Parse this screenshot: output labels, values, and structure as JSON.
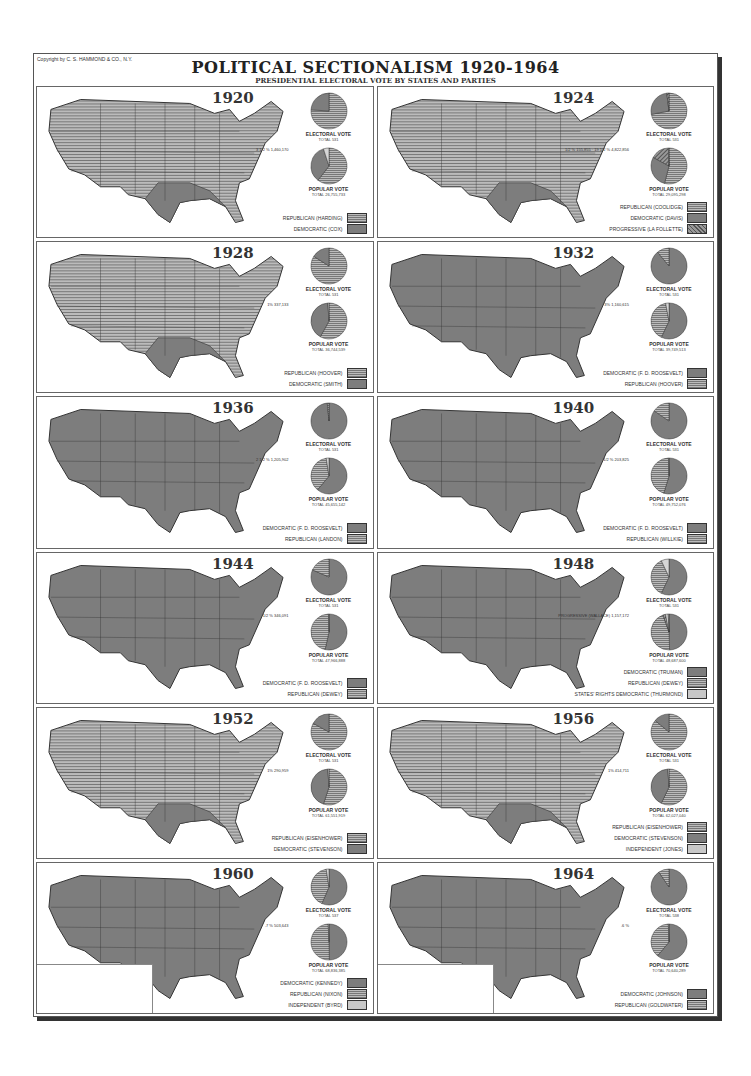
{
  "header": {
    "copyright": "Copyright by C. S. HAMMOND & CO., N.Y.",
    "title": "POLITICAL SECTIONALISM 1920-1964",
    "subtitle": "PRESIDENTIAL ELECTORAL VOTE BY STATES AND PARTIES"
  },
  "colors": {
    "republican": "#b3b3b3",
    "democratic": "#7d7d7d",
    "progressive": "#8a8a8a",
    "independent": "#c8c8c8"
  },
  "labels": {
    "electoral": "ELECTORAL VOTE",
    "popular": "POPULAR VOTE",
    "minor": "MINOR"
  },
  "panels": [
    {
      "year": "1920",
      "electoral_total": "TOTAL 531",
      "popular_total": "TOTAL 26,755,733",
      "minor": "3 1/2 % 1,460,170",
      "legend": [
        {
          "label": "REPUBLICAN (HARDING)",
          "type": "rep"
        },
        {
          "label": "DEMOCRATIC (COX)",
          "type": "dem"
        }
      ]
    },
    {
      "year": "1924",
      "electoral_total": "TOTAL 531",
      "popular_total": "TOTAL 29,095,298",
      "minor": "1/2 % 155,855 · 19 1/2 % 4,822,856",
      "legend": [
        {
          "label": "REPUBLICAN (COOLIDGE)",
          "type": "rep"
        },
        {
          "label": "DEMOCRATIC (DAVIS)",
          "type": "dem"
        },
        {
          "label": "PROGRESSIVE (LA FOLLETTE)",
          "type": "prog"
        }
      ]
    },
    {
      "year": "1928",
      "electoral_total": "TOTAL 531",
      "popular_total": "TOTAL 36,744,539",
      "minor": "1% 337,133",
      "legend": [
        {
          "label": "REPUBLICAN (HOOVER)",
          "type": "rep"
        },
        {
          "label": "DEMOCRATIC (SMITH)",
          "type": "dem"
        }
      ]
    },
    {
      "year": "1932",
      "electoral_total": "TOTAL 531",
      "popular_total": "TOTAL 39,749,513",
      "minor": "3% 1,160,615",
      "legend": [
        {
          "label": "DEMOCRATIC (F. D. ROOSEVELT)",
          "type": "dem"
        },
        {
          "label": "REPUBLICAN (HOOVER)",
          "type": "rep"
        }
      ]
    },
    {
      "year": "1936",
      "electoral_total": "TOTAL 531",
      "popular_total": "TOTAL 45,655,142",
      "minor": "2 1/2 % 1,205,902",
      "legend": [
        {
          "label": "DEMOCRATIC (F. D. ROOSEVELT)",
          "type": "dem"
        },
        {
          "label": "REPUBLICAN (LANDON)",
          "type": "rep"
        }
      ]
    },
    {
      "year": "1940",
      "electoral_total": "TOTAL 531",
      "popular_total": "TOTAL 49,752,076",
      "minor": "1/2 % 203,825",
      "legend": [
        {
          "label": "DEMOCRATIC (F. D. ROOSEVELT)",
          "type": "dem"
        },
        {
          "label": "REPUBLICAN (WILLKIE)",
          "type": "rep"
        }
      ]
    },
    {
      "year": "1944",
      "electoral_total": "TOTAL 531",
      "popular_total": "TOTAL 47,966,888",
      "minor": "1/2 % 346,091",
      "legend": [
        {
          "label": "DEMOCRATIC (F. D. ROOSEVELT)",
          "type": "dem"
        },
        {
          "label": "REPUBLICAN (DEWEY)",
          "type": "rep"
        }
      ]
    },
    {
      "year": "1948",
      "electoral_total": "TOTAL 531",
      "popular_total": "TOTAL 48,687,600",
      "minor": "PROGRESSIVE (WALLACE) 1,157,172",
      "legend": [
        {
          "label": "DEMOCRATIC (TRUMAN)",
          "type": "dem"
        },
        {
          "label": "REPUBLICAN (DEWEY)",
          "type": "rep"
        },
        {
          "label": "STATES' RIGHTS DEMOCRATIC (THURMOND)",
          "type": "ind"
        }
      ]
    },
    {
      "year": "1952",
      "electoral_total": "TOTAL 531",
      "popular_total": "TOTAL 61,551,919",
      "minor": "1% 290,959",
      "legend": [
        {
          "label": "REPUBLICAN (EISENHOWER)",
          "type": "rep"
        },
        {
          "label": "DEMOCRATIC (STEVENSON)",
          "type": "dem"
        }
      ]
    },
    {
      "year": "1956",
      "electoral_total": "TOTAL 531",
      "popular_total": "TOTAL 62,027,040",
      "minor": "1% 414,711",
      "legend": [
        {
          "label": "REPUBLICAN (EISENHOWER)",
          "type": "rep"
        },
        {
          "label": "DEMOCRATIC (STEVENSON)",
          "type": "dem"
        },
        {
          "label": "INDEPENDENT (JONES)",
          "type": "ind"
        }
      ]
    },
    {
      "year": "1960",
      "electoral_total": "TOTAL 537",
      "popular_total": "TOTAL 68,836,385",
      "minor": ".7 % 503,643",
      "legend": [
        {
          "label": "DEMOCRATIC (KENNEDY)",
          "type": "dem"
        },
        {
          "label": "REPUBLICAN (NIXON)",
          "type": "rep"
        },
        {
          "label": "INDEPENDENT (BYRD)",
          "type": "ind"
        }
      ]
    },
    {
      "year": "1964",
      "electoral_total": "TOTAL 538",
      "popular_total": "TOTAL 70,640,289",
      "minor": ".6 %",
      "legend": [
        {
          "label": "DEMOCRATIC (JOHNSON)",
          "type": "dem"
        },
        {
          "label": "REPUBLICAN (GOLDWATER)",
          "type": "rep"
        }
      ]
    }
  ],
  "chart_data": [
    {
      "type": "pie",
      "title": "1920 Electoral Vote",
      "categories": [
        "Republican",
        "Democratic"
      ],
      "values": [
        76,
        24
      ]
    },
    {
      "type": "pie",
      "title": "1920 Popular Vote",
      "categories": [
        "Republican",
        "Democratic",
        "Minor"
      ],
      "values": [
        60.5,
        34.5,
        5
      ]
    },
    {
      "type": "pie",
      "title": "1924 Electoral Vote",
      "categories": [
        "Republican",
        "Democratic",
        "Progressive"
      ],
      "values": [
        72,
        26,
        2
      ]
    },
    {
      "type": "pie",
      "title": "1924 Popular Vote",
      "categories": [
        "Republican",
        "Democratic",
        "Progressive",
        "Minor"
      ],
      "values": [
        54,
        29,
        16.5,
        0.5
      ]
    },
    {
      "type": "pie",
      "title": "1928 Electoral Vote",
      "categories": [
        "Republican",
        "Democratic"
      ],
      "values": [
        84,
        16
      ]
    },
    {
      "type": "pie",
      "title": "1928 Popular Vote",
      "categories": [
        "Republican",
        "Democratic",
        "Minor"
      ],
      "values": [
        58,
        41,
        1
      ]
    },
    {
      "type": "pie",
      "title": "1932 Electoral Vote",
      "categories": [
        "Democratic",
        "Republican"
      ],
      "values": [
        89,
        11
      ]
    },
    {
      "type": "pie",
      "title": "1932 Popular Vote",
      "categories": [
        "Democratic",
        "Republican",
        "Minor"
      ],
      "values": [
        57,
        40,
        3
      ]
    },
    {
      "type": "pie",
      "title": "1936 Electoral Vote",
      "categories": [
        "Democratic",
        "Republican"
      ],
      "values": [
        98.5,
        1.5
      ]
    },
    {
      "type": "pie",
      "title": "1936 Popular Vote",
      "categories": [
        "Democratic",
        "Republican",
        "Minor"
      ],
      "values": [
        61,
        36.5,
        2.5
      ]
    },
    {
      "type": "pie",
      "title": "1940 Electoral Vote",
      "categories": [
        "Democratic",
        "Republican"
      ],
      "values": [
        84.5,
        15.5
      ]
    },
    {
      "type": "pie",
      "title": "1940 Popular Vote",
      "categories": [
        "Democratic",
        "Republican",
        "Minor"
      ],
      "values": [
        54.7,
        44.8,
        0.5
      ]
    },
    {
      "type": "pie",
      "title": "1944 Electoral Vote",
      "categories": [
        "Democratic",
        "Republican"
      ],
      "values": [
        81.5,
        18.5
      ]
    },
    {
      "type": "pie",
      "title": "1944 Popular Vote",
      "categories": [
        "Democratic",
        "Republican",
        "Minor"
      ],
      "values": [
        53.5,
        46,
        0.5
      ]
    },
    {
      "type": "pie",
      "title": "1948 Electoral Vote",
      "categories": [
        "Democratic",
        "Republican",
        "States' Rights"
      ],
      "values": [
        57,
        36,
        7
      ]
    },
    {
      "type": "pie",
      "title": "1948 Popular Vote",
      "categories": [
        "Democratic",
        "Republican",
        "Progressive",
        "States' Rights",
        "Minor"
      ],
      "values": [
        49.5,
        45,
        2.4,
        2.4,
        0.7
      ]
    },
    {
      "type": "pie",
      "title": "1952 Electoral Vote",
      "categories": [
        "Republican",
        "Democratic"
      ],
      "values": [
        83,
        17
      ]
    },
    {
      "type": "pie",
      "title": "1952 Popular Vote",
      "categories": [
        "Republican",
        "Democratic",
        "Minor"
      ],
      "values": [
        55,
        44,
        1
      ]
    },
    {
      "type": "pie",
      "title": "1956 Electoral Vote",
      "categories": [
        "Republican",
        "Democratic",
        "Independent"
      ],
      "values": [
        86,
        14,
        0
      ]
    },
    {
      "type": "pie",
      "title": "1956 Popular Vote",
      "categories": [
        "Republican",
        "Democratic",
        "Minor"
      ],
      "values": [
        57,
        42,
        1
      ]
    },
    {
      "type": "pie",
      "title": "1960 Electoral Vote",
      "categories": [
        "Democratic",
        "Republican",
        "Independent"
      ],
      "values": [
        56.5,
        41,
        2.5
      ]
    },
    {
      "type": "pie",
      "title": "1960 Popular Vote",
      "categories": [
        "Democratic",
        "Republican",
        "Minor"
      ],
      "values": [
        49.7,
        49.6,
        0.7
      ]
    },
    {
      "type": "pie",
      "title": "1964 Electoral Vote",
      "categories": [
        "Democratic",
        "Republican"
      ],
      "values": [
        90.5,
        9.5
      ]
    },
    {
      "type": "pie",
      "title": "1964 Popular Vote",
      "categories": [
        "Democratic",
        "Republican",
        "Minor"
      ],
      "values": [
        61,
        38.4,
        0.6
      ]
    }
  ]
}
